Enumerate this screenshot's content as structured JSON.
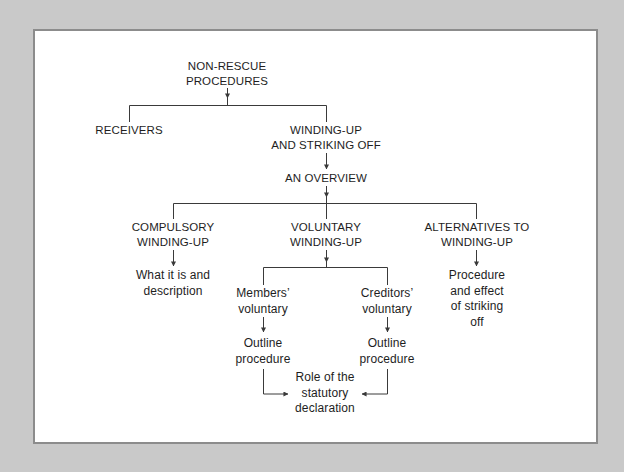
{
  "diagram": {
    "root": {
      "lines": [
        "NON-RESCUE",
        "PROCEDURES"
      ]
    },
    "receivers": {
      "lines": [
        "RECEIVERS"
      ]
    },
    "winding_up": {
      "lines": [
        "WINDING-UP",
        "AND STRIKING OFF"
      ]
    },
    "overview": {
      "lines": [
        "AN OVERVIEW"
      ]
    },
    "compulsory": {
      "lines": [
        "COMPULSORY",
        "WINDING-UP"
      ],
      "child": {
        "lines": [
          "What it is and",
          "description"
        ]
      }
    },
    "voluntary": {
      "lines": [
        "VOLUNTARY",
        "WINDING-UP"
      ],
      "members": {
        "lines": [
          "Members’",
          "voluntary"
        ],
        "child": {
          "lines": [
            "Outline",
            "procedure"
          ]
        }
      },
      "creditors": {
        "lines": [
          "Creditors’",
          "voluntary"
        ],
        "child": {
          "lines": [
            "Outline",
            "procedure"
          ]
        }
      },
      "shared": {
        "lines": [
          "Role of the",
          "statutory",
          "declaration"
        ]
      }
    },
    "alternatives": {
      "lines": [
        "ALTERNATIVES TO",
        "WINDING-UP"
      ],
      "child": {
        "lines": [
          "Procedure",
          "and effect",
          "of striking",
          "off"
        ]
      }
    }
  },
  "colors": {
    "background": "#c9c9c9",
    "panel": "#ffffff",
    "panel_border": "#8c8c8c",
    "text": "#1e1e1e",
    "connector": "#3a3a3a"
  }
}
